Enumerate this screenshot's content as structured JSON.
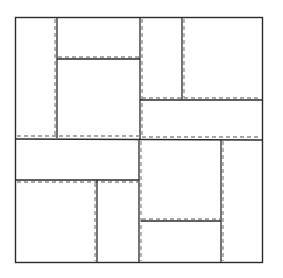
{
  "diagram": {
    "type": "rectangle-packing",
    "colors": {
      "background": "#ffffff",
      "solid": "#2a2a2a",
      "dashed": "#8a8a8a"
    },
    "outer": {
      "x": 15.5,
      "y": 17.5,
      "w": 247,
      "h": 245
    },
    "solid_lines": [
      {
        "x1": 57,
        "y1": 17.5,
        "x2": 57,
        "y2": 138
      },
      {
        "x1": 140,
        "y1": 17.5,
        "x2": 140,
        "y2": 139
      },
      {
        "x1": 57,
        "y1": 59,
        "x2": 140,
        "y2": 59
      },
      {
        "x1": 182,
        "y1": 17.5,
        "x2": 182,
        "y2": 100
      },
      {
        "x1": 140,
        "y1": 100,
        "x2": 262.5,
        "y2": 100
      },
      {
        "x1": 15.5,
        "y1": 139,
        "x2": 262.5,
        "y2": 140
      },
      {
        "x1": 15.5,
        "y1": 180,
        "x2": 139,
        "y2": 180
      },
      {
        "x1": 97,
        "y1": 180,
        "x2": 97,
        "y2": 262.5
      },
      {
        "x1": 139,
        "y1": 139,
        "x2": 139,
        "y2": 262.5
      },
      {
        "x1": 141,
        "y1": 221,
        "x2": 221,
        "y2": 221
      },
      {
        "x1": 221,
        "y1": 140,
        "x2": 221,
        "y2": 262.5
      }
    ],
    "dashed_lines": [
      {
        "x1": 55,
        "y1": 19,
        "x2": 55,
        "y2": 136
      },
      {
        "x1": 142,
        "y1": 19,
        "x2": 142,
        "y2": 137
      },
      {
        "x1": 58,
        "y1": 57,
        "x2": 139,
        "y2": 57
      },
      {
        "x1": 184,
        "y1": 19,
        "x2": 184,
        "y2": 98
      },
      {
        "x1": 142,
        "y1": 98,
        "x2": 261,
        "y2": 98
      },
      {
        "x1": 17,
        "y1": 136,
        "x2": 139,
        "y2": 136
      },
      {
        "x1": 142,
        "y1": 137,
        "x2": 261,
        "y2": 137
      },
      {
        "x1": 17,
        "y1": 182,
        "x2": 138,
        "y2": 182
      },
      {
        "x1": 95,
        "y1": 183,
        "x2": 95,
        "y2": 261
      },
      {
        "x1": 141,
        "y1": 141,
        "x2": 141,
        "y2": 261
      },
      {
        "x1": 142,
        "y1": 219,
        "x2": 220,
        "y2": 219
      },
      {
        "x1": 223,
        "y1": 141,
        "x2": 223,
        "y2": 261
      }
    ]
  }
}
